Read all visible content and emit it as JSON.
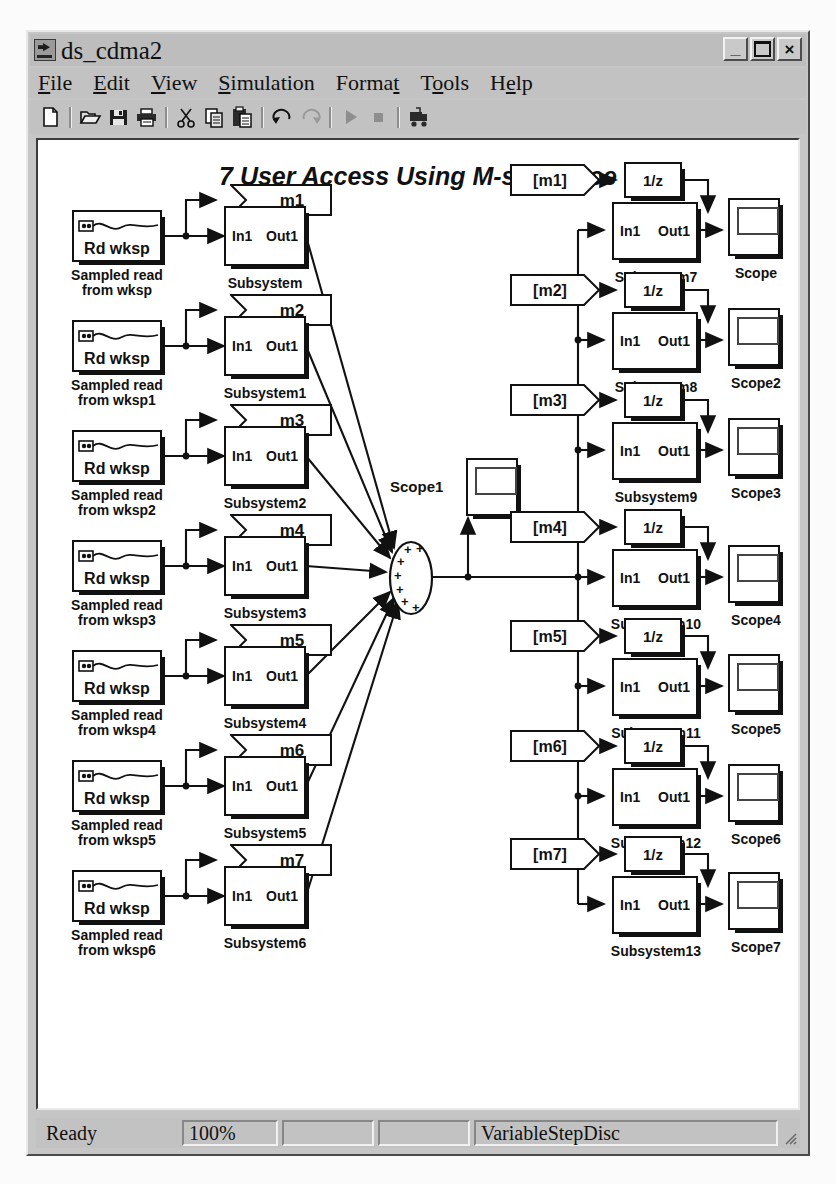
{
  "window": {
    "title": "ds_cdma2",
    "icon": "simulink-icon",
    "buttons": [
      {
        "name": "minimize-button",
        "glyph": "_"
      },
      {
        "name": "maximize-button",
        "glyph": ""
      },
      {
        "name": "close-button",
        "glyph": "×"
      }
    ]
  },
  "menubar": {
    "items": [
      {
        "name": "menu-file",
        "label": "File",
        "pre": "",
        "mnemonic": "F",
        "post": "ile"
      },
      {
        "name": "menu-edit",
        "label": "Edit",
        "pre": "",
        "mnemonic": "E",
        "post": "dit"
      },
      {
        "name": "menu-view",
        "label": "View",
        "pre": "",
        "mnemonic": "V",
        "post": "iew"
      },
      {
        "name": "menu-simulation",
        "label": "Simulation",
        "pre": "",
        "mnemonic": "S",
        "post": "imulation"
      },
      {
        "name": "menu-format",
        "label": "Format",
        "pre": "Forma",
        "mnemonic": "t",
        "post": ""
      },
      {
        "name": "menu-tools",
        "label": "Tools",
        "pre": "T",
        "mnemonic": "o",
        "post": "ols"
      },
      {
        "name": "menu-help",
        "label": "Help",
        "pre": "H",
        "mnemonic": "e",
        "post": "lp"
      }
    ]
  },
  "toolbar": {
    "items": [
      {
        "name": "new-model-icon",
        "tip": "New model"
      },
      {
        "sep": true
      },
      {
        "name": "open-model-icon",
        "tip": "Open model"
      },
      {
        "name": "save-icon",
        "tip": "Save"
      },
      {
        "name": "print-icon",
        "tip": "Print"
      },
      {
        "sep": true
      },
      {
        "name": "cut-icon",
        "tip": "Cut"
      },
      {
        "name": "copy-icon",
        "tip": "Copy"
      },
      {
        "name": "paste-icon",
        "tip": "Paste"
      },
      {
        "sep": true
      },
      {
        "name": "undo-icon",
        "tip": "Undo"
      },
      {
        "name": "redo-icon",
        "tip": "Redo"
      },
      {
        "sep": true
      },
      {
        "name": "start-simulation-icon",
        "tip": "Start simulation"
      },
      {
        "name": "stop-simulation-icon",
        "tip": "Stop simulation"
      },
      {
        "sep": true
      },
      {
        "name": "build-model-icon",
        "tip": "Build model"
      }
    ]
  },
  "diagram": {
    "title": "7 User Access Using M-sequence",
    "source_block_name": "Rd wksp",
    "port_in": "In1",
    "port_out": "Out1",
    "delay_label": "1/z",
    "scope1_label": "Scope1",
    "left_rows": [
      {
        "source_label": "Sampled read\nfrom wksp",
        "goto_tag": "m1",
        "subsystem": "Subsystem"
      },
      {
        "source_label": "Sampled read\nfrom wksp1",
        "goto_tag": "m2",
        "subsystem": "Subsystem1"
      },
      {
        "source_label": "Sampled read\nfrom wksp2",
        "goto_tag": "m3",
        "subsystem": "Subsystem2"
      },
      {
        "source_label": "Sampled read\nfrom wksp3",
        "goto_tag": "m4",
        "subsystem": "Subsystem3"
      },
      {
        "source_label": "Sampled read\nfrom wksp4",
        "goto_tag": "m5",
        "subsystem": "Subsystem4"
      },
      {
        "source_label": "Sampled read\nfrom wksp5",
        "goto_tag": "m6",
        "subsystem": "Subsystem5"
      },
      {
        "source_label": "Sampled read\nfrom wksp6",
        "goto_tag": "m7",
        "subsystem": "Subsystem6"
      }
    ],
    "right_rows": [
      {
        "from_tag": "[m1]",
        "subsystem": "Subsystem7",
        "scope": "Scope"
      },
      {
        "from_tag": "[m2]",
        "subsystem": "Subsystem8",
        "scope": "Scope2"
      },
      {
        "from_tag": "[m3]",
        "subsystem": "Subsystem9",
        "scope": "Scope3"
      },
      {
        "from_tag": "[m4]",
        "subsystem": "Subsystem10",
        "scope": "Scope4"
      },
      {
        "from_tag": "[m5]",
        "subsystem": "Subsystem11",
        "scope": "Scope5"
      },
      {
        "from_tag": "[m6]",
        "subsystem": "Subsystem12",
        "scope": "Scope6"
      },
      {
        "from_tag": "[m7]",
        "subsystem": "Subsystem13",
        "scope": "Scope7"
      }
    ],
    "sum_signs": [
      "+",
      "+",
      "+",
      "+",
      "+",
      "+",
      "+"
    ]
  },
  "statusbar": {
    "status": "Ready",
    "zoom": "100%",
    "pane3": "",
    "pane4": "",
    "solver": "VariableStepDisc"
  },
  "colors": {
    "window_face": "#c6c6c6",
    "canvas": "#ffffff",
    "line": "#111111",
    "page": "#fbfbfb"
  }
}
